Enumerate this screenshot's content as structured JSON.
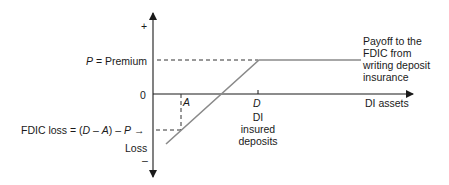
{
  "diagram": {
    "type": "payoff-diagram",
    "y_axis": {
      "top_sign": "+",
      "bottom_sign": "–",
      "zero_label": "0",
      "bottom_label": "Loss"
    },
    "x_axis": {
      "label": "DI assets"
    },
    "premium_label": {
      "var": "P",
      "text": " = Premium"
    },
    "fdic_loss_label": {
      "prefix": "FDIC loss = (",
      "d": "D",
      "minus1": " – ",
      "a": "A",
      "mid": ") – ",
      "p": "P",
      "arrow": " →"
    },
    "point_a": "A",
    "point_d": "D",
    "d_caption": [
      "DI",
      "insured",
      "deposits"
    ],
    "payoff_caption": [
      "Payoff to the",
      "FDIC from",
      "writing deposit",
      "insurance"
    ],
    "colors": {
      "axis": "#1a1a1a",
      "payoff_line": "#8a8a8a",
      "dashed": "#333333",
      "text": "#1a1a1a"
    }
  }
}
